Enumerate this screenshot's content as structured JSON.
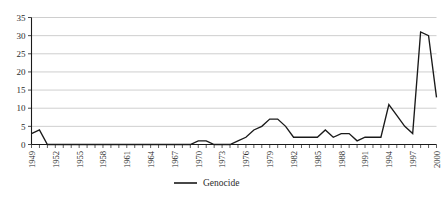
{
  "chart_data": {
    "type": "line",
    "title": "",
    "subtitle": "",
    "xlabel": "",
    "ylabel": "",
    "xlim": [
      1949,
      2000
    ],
    "ylim": [
      0,
      35
    ],
    "yticks": [
      0,
      5,
      10,
      15,
      20,
      25,
      30,
      35
    ],
    "ytick_labels": [
      "0",
      "5",
      "10",
      "15",
      "20",
      "25",
      "30",
      "35"
    ],
    "xticks": [
      1949,
      1952,
      1955,
      1958,
      1961,
      1964,
      1967,
      1970,
      1973,
      1976,
      1979,
      1982,
      1985,
      1988,
      1991,
      1994,
      1997,
      2000
    ],
    "xtick_labels": [
      "1949",
      "1952",
      "1955",
      "1958",
      "1961",
      "1964",
      "1967",
      "1970",
      "1973",
      "1976",
      "1979",
      "1982",
      "1985",
      "1988",
      "1991",
      "1994",
      "1997",
      "2000"
    ],
    "grid": true,
    "grid_axis": "y",
    "legend_position": "bottom",
    "legend": [
      "Genocide"
    ],
    "series": [
      {
        "name": "Genocide",
        "color": "#1a1a1a",
        "x": [
          1949,
          1950,
          1951,
          1952,
          1953,
          1954,
          1955,
          1956,
          1957,
          1958,
          1959,
          1960,
          1961,
          1962,
          1963,
          1964,
          1965,
          1966,
          1967,
          1968,
          1969,
          1970,
          1971,
          1972,
          1973,
          1974,
          1975,
          1976,
          1977,
          1978,
          1979,
          1980,
          1981,
          1982,
          1983,
          1984,
          1985,
          1986,
          1987,
          1988,
          1989,
          1990,
          1991,
          1992,
          1993,
          1994,
          1995,
          1996,
          1997,
          1998,
          1999,
          2000
        ],
        "values": [
          3,
          4,
          0,
          0,
          0,
          0,
          0,
          0,
          0,
          0,
          0,
          0,
          0,
          0,
          0,
          0,
          0,
          0,
          0,
          0,
          0,
          1,
          1,
          0,
          0,
          0,
          1,
          2,
          4,
          5,
          7,
          7,
          5,
          2,
          2,
          2,
          2,
          4,
          2,
          3,
          3,
          1,
          2,
          2,
          2,
          11,
          8,
          5,
          3,
          31,
          30,
          13
        ]
      }
    ]
  }
}
